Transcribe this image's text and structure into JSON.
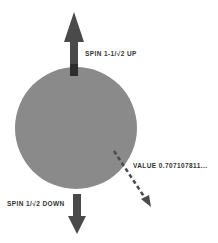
{
  "diagram": {
    "sphere": {
      "color": "#8a8a8a"
    },
    "arrow_color": "#4a4a4a",
    "labels": {
      "spin_up": "SPIN 1-1/√2 UP",
      "spin_down": "SPIN 1/√2 DOWN",
      "value": "VALUE 0.707107811..."
    }
  }
}
